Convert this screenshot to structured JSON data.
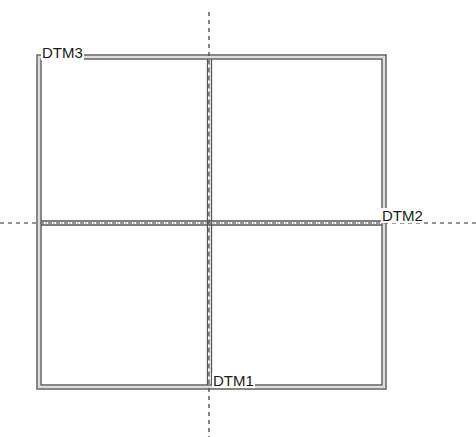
{
  "diagram": {
    "type": "quadrant-grid",
    "labels": {
      "top_left": "DTM3",
      "right_axis": "DTM2",
      "bottom_axis": "DTM1"
    },
    "colors": {
      "line": "#3a3a3a",
      "line_light": "#8a8a8a",
      "dashed": "#333333",
      "background": "#ffffff"
    }
  }
}
